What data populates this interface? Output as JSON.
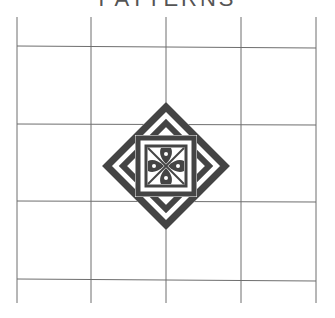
{
  "title": {
    "text": "PATTERNS",
    "visible": "partially cut off at top edge"
  },
  "grid": {
    "columns": 4,
    "rows": 4,
    "line_color": "#6e6e6e",
    "x_lines": [
      17,
      91,
      166,
      241,
      316
    ],
    "y_lines": [
      47,
      124,
      201,
      280
    ],
    "top": 17,
    "bottom": 303
  },
  "emblem": {
    "center": [
      166,
      166
    ],
    "stroke_color": "#444444",
    "description": "Nested diamonds framing a square containing a four-petal cross motif"
  },
  "colors": {
    "background": "#ffffff",
    "ink": "#444444",
    "grid": "#6e6e6e"
  }
}
